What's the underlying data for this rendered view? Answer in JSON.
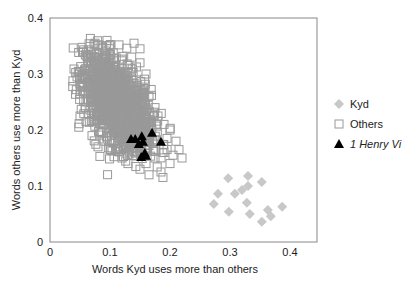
{
  "chart_data": {
    "type": "scatter",
    "title": "",
    "xlabel": "Words Kyd uses more than others",
    "ylabel": "Words others use more than Kyd",
    "xlim": [
      0,
      0.44
    ],
    "ylim": [
      0,
      0.4
    ],
    "xticks": [
      0,
      0.1,
      0.2,
      0.3,
      0.4
    ],
    "xtick_labels": [
      "0",
      "0.1",
      "0.2",
      "0.3",
      "0.4"
    ],
    "yticks": [
      0,
      0.1,
      0.2,
      0.3,
      0.4
    ],
    "ytick_labels": [
      "0",
      "0.1",
      "0.2",
      "0.3",
      "0.4"
    ],
    "grid": false,
    "legend_position": "right",
    "series": [
      {
        "name": "Kyd",
        "marker": "diamond",
        "color": "#c8c8c8",
        "points": [
          [
            0.297,
            0.114
          ],
          [
            0.33,
            0.118
          ],
          [
            0.353,
            0.107
          ],
          [
            0.28,
            0.086
          ],
          [
            0.308,
            0.086
          ],
          [
            0.32,
            0.093
          ],
          [
            0.33,
            0.1
          ],
          [
            0.273,
            0.068
          ],
          [
            0.328,
            0.07
          ],
          [
            0.298,
            0.054
          ],
          [
            0.333,
            0.05
          ],
          [
            0.363,
            0.057
          ],
          [
            0.387,
            0.063
          ],
          [
            0.353,
            0.036
          ],
          [
            0.368,
            0.046
          ]
        ]
      },
      {
        "name": "Others",
        "marker": "open-square",
        "color": "#999999",
        "description": "Dense cloud of several thousand points centered near (0.11, 0.25), elongated downward-right; range approx x 0.04–0.23, y 0.12–0.36",
        "cloud": {
          "cx": 0.112,
          "cy": 0.248,
          "sx": 0.028,
          "sy": 0.042,
          "rho": -0.55,
          "count": 1400
        },
        "points": [
          [
            0.075,
            0.355
          ],
          [
            0.085,
            0.35
          ],
          [
            0.095,
            0.36
          ],
          [
            0.1,
            0.345
          ],
          [
            0.115,
            0.352
          ],
          [
            0.128,
            0.346
          ],
          [
            0.14,
            0.355
          ],
          [
            0.15,
            0.345
          ],
          [
            0.07,
            0.33
          ],
          [
            0.08,
            0.32
          ],
          [
            0.15,
            0.32
          ],
          [
            0.16,
            0.3
          ],
          [
            0.055,
            0.27
          ],
          [
            0.06,
            0.25
          ],
          [
            0.05,
            0.225
          ],
          [
            0.048,
            0.205
          ],
          [
            0.06,
            0.215
          ],
          [
            0.165,
            0.26
          ],
          [
            0.175,
            0.24
          ],
          [
            0.18,
            0.225
          ],
          [
            0.19,
            0.21
          ],
          [
            0.2,
            0.2
          ],
          [
            0.195,
            0.185
          ],
          [
            0.21,
            0.18
          ],
          [
            0.215,
            0.165
          ],
          [
            0.205,
            0.155
          ],
          [
            0.19,
            0.16
          ],
          [
            0.175,
            0.15
          ],
          [
            0.16,
            0.14
          ],
          [
            0.15,
            0.13
          ],
          [
            0.165,
            0.12
          ],
          [
            0.185,
            0.125
          ],
          [
            0.2,
            0.14
          ],
          [
            0.22,
            0.15
          ],
          [
            0.13,
            0.14
          ],
          [
            0.12,
            0.15
          ],
          [
            0.09,
            0.18
          ],
          [
            0.08,
            0.17
          ],
          [
            0.07,
            0.19
          ],
          [
            0.1,
            0.165
          ]
        ]
      },
      {
        "name": "1 Henry VI",
        "marker": "filled-triangle",
        "color": "#000000",
        "points": [
          [
            0.135,
            0.184
          ],
          [
            0.142,
            0.184
          ],
          [
            0.153,
            0.189
          ],
          [
            0.17,
            0.195
          ],
          [
            0.148,
            0.175
          ],
          [
            0.155,
            0.179
          ],
          [
            0.185,
            0.179
          ],
          [
            0.158,
            0.159
          ],
          [
            0.152,
            0.152
          ],
          [
            0.16,
            0.154
          ]
        ]
      }
    ]
  },
  "legend": {
    "items": [
      {
        "label": "Kyd",
        "marker": "diamond"
      },
      {
        "label": "Others",
        "marker": "open-square"
      },
      {
        "label": "1 Henry Vi",
        "marker": "filled-triangle"
      }
    ]
  }
}
